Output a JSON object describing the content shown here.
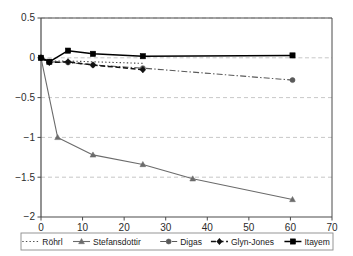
{
  "chart_data": {
    "type": "line",
    "title": "",
    "subtitle": "",
    "xlabel": "",
    "ylabel": "",
    "xlim": [
      0,
      70
    ],
    "ylim": [
      -2,
      0.5
    ],
    "xticks": [
      0,
      10,
      20,
      30,
      40,
      50,
      60,
      70
    ],
    "xtick_labels": [
      "0",
      "10",
      "20",
      "30",
      "40",
      "50",
      "60",
      "70"
    ],
    "yticks": [
      0.5,
      0,
      -0.5,
      -1,
      -1.5,
      -2
    ],
    "ytick_labels": [
      "0.5",
      "0",
      "−0.5",
      "−1",
      "−1.5",
      "−2"
    ],
    "grid": {
      "horizontal": true,
      "vertical": false,
      "style": "dashed",
      "color": "#b9b9b9"
    },
    "legend_position": "bottom",
    "series": [
      {
        "name": "Röhrl",
        "marker": "none",
        "line_style": "dotted",
        "color": "#4d4d4d",
        "x": [
          0,
          2,
          6.5,
          12.5,
          24.5
        ],
        "values": [
          0,
          -0.04,
          -0.04,
          -0.05,
          -0.07
        ]
      },
      {
        "name": "Stefansdottir",
        "marker": "triangle",
        "line_style": "solid",
        "color": "#6b6b6b",
        "x": [
          0,
          4,
          12.5,
          24.5,
          36.5,
          60.5
        ],
        "values": [
          0,
          -1.0,
          -1.22,
          -1.34,
          -1.52,
          -1.78
        ]
      },
      {
        "name": "Digas",
        "marker": "circle",
        "line_style": "dashdot",
        "color": "#5a5a5a",
        "x": [
          0,
          2,
          6.5,
          12.5,
          24.5,
          60.5
        ],
        "values": [
          0,
          -0.05,
          -0.06,
          -0.09,
          -0.13,
          -0.28
        ]
      },
      {
        "name": "Glyn-Jones",
        "marker": "diamond",
        "line_style": "dashed",
        "color": "#111111",
        "x": [
          0,
          2,
          6.5,
          12.5,
          24.5
        ],
        "values": [
          0,
          -0.06,
          -0.05,
          -0.09,
          -0.15
        ]
      },
      {
        "name": "Itayem",
        "marker": "square",
        "line_style": "solid",
        "color": "#000000",
        "x": [
          0,
          2,
          6.5,
          12.5,
          24.5,
          60.5
        ],
        "values": [
          0,
          -0.05,
          0.09,
          0.05,
          0.02,
          0.03
        ]
      }
    ]
  },
  "legend": {
    "entries": [
      {
        "label": "Röhrl"
      },
      {
        "label": "Stefansdottir"
      },
      {
        "label": "Digas"
      },
      {
        "label": "Glyn-Jones"
      },
      {
        "label": "Itayem"
      }
    ]
  },
  "colors": {
    "axis": "#4a4a4a",
    "grid": "#b9b9b9",
    "text": "#222222",
    "legend_border": "#8a8a8a"
  }
}
